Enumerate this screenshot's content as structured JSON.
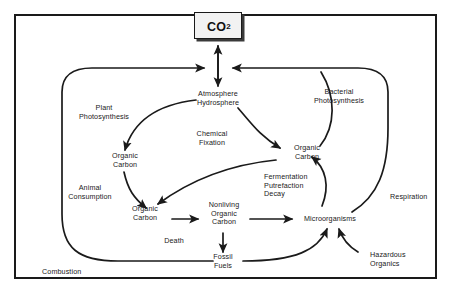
{
  "diagram": {
    "type": "flow-diagram",
    "border_color": "#1a1a1a",
    "background_color": "#ffffff",
    "line_color": "#1a1a1a"
  },
  "co2_box": {
    "label": "CO",
    "superscript": "2",
    "fill": "#f2f2f2"
  },
  "nodes": {
    "atmosphere_hydrosphere": "Atmosphere\nHydrosphere",
    "organic_carbon_plant": "Organic\nCarbon",
    "organic_carbon_animal": "Organic\nCarbon",
    "organic_carbon_bacterial": "Organic\nCarbon",
    "nonliving_organic_carbon": "Nonliving\nOrganic\nCarbon",
    "microorganisms": "Microorganisms",
    "fossil_fuels": "Fossil\nFuels"
  },
  "process_labels": {
    "plant_photosynthesis": "Plant\nPhotosynthesis",
    "bacterial_photosynthesis": "Bacterial\nPhotosynthesis",
    "chemical_fixation": "Chemical\nFixation",
    "animal_consumption": "Animal\nConsumption",
    "fermentation_putrefaction_decay": "Fermentation\nPutrefaction\nDecay",
    "respiration": "Respiration",
    "death": "Death",
    "combustion": "Combustion",
    "hazardous_organics": "Hazardous\nOrganics"
  }
}
